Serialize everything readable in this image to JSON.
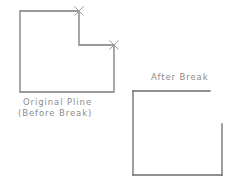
{
  "drawing": {
    "background_color": "#ffffff",
    "line_color": "#7a7a7a",
    "line_color_dark": "#6b6b6b",
    "marker_color": "#9a9a9a",
    "text_color": "#8c8c8c",
    "line_width": 1.3,
    "width": 244,
    "height": 183
  },
  "labels": {
    "original_pline": "Original Pline",
    "before_break": "(Before Break)",
    "after_break": "After Break"
  },
  "shapes": {
    "original_pline": {
      "name": "Original Pline (Before Break)",
      "type": "closed-polyline",
      "points": "20,11 79,11 79,45 114,45 114,92 20,92 20,11",
      "vertices": [
        [
          20,
          11
        ],
        [
          79,
          11
        ],
        [
          79,
          45
        ],
        [
          114,
          45
        ],
        [
          114,
          92
        ],
        [
          20,
          92
        ]
      ]
    },
    "after_break": {
      "name": "After Break",
      "type": "open-polyline",
      "segments": [
        {
          "name": "top-edge",
          "points": "210,91 133,91"
        },
        {
          "name": "left-edge",
          "points": "133,91 133,175"
        },
        {
          "name": "bottom-edge",
          "points": "133,175 222,175"
        },
        {
          "name": "right-edge",
          "points": "222,175 222,124"
        }
      ],
      "removed_segment_note": "notch corner segment removed by break"
    }
  },
  "break_markers": [
    {
      "name": "break-point-1",
      "x": 79,
      "y": 11,
      "size": 4.5
    },
    {
      "name": "break-point-2",
      "x": 114,
      "y": 45,
      "size": 4.5
    }
  ]
}
